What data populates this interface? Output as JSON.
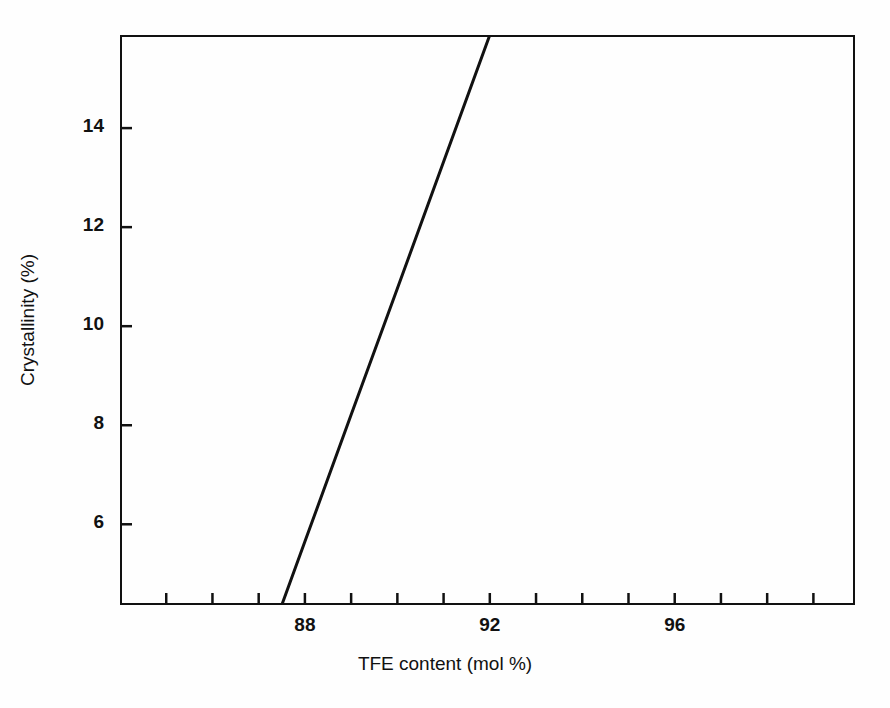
{
  "chart_data": {
    "type": "line",
    "title": "",
    "subtitle": "",
    "xlabel": "TFE content (mol %)",
    "ylabel": "Crystallinity (%)",
    "xlim": [
      84.0,
      99.9
    ],
    "ylim": [
      4.37,
      15.88
    ],
    "grid": false,
    "legend": null,
    "legend_position": "none",
    "x_tick_values": [
      84,
      85,
      86,
      87,
      88,
      89,
      90,
      91,
      92,
      93,
      94,
      95,
      96,
      97,
      98,
      99
    ],
    "x_tick_labels": [
      "",
      "",
      "",
      "",
      "88",
      "",
      "",
      "",
      "92",
      "",
      "",
      "",
      "96",
      "",
      "",
      ""
    ],
    "x_labeled_ticks": [
      {
        "value": 88,
        "label": "88"
      },
      {
        "value": 92,
        "label": "92"
      },
      {
        "value": 96,
        "label": "96"
      }
    ],
    "y_tick_values": [
      6,
      8,
      10,
      12,
      14
    ],
    "y_tick_labels": [
      "6",
      "8",
      "10",
      "12",
      "14"
    ],
    "series": [
      {
        "name": "Crystallinity vs TFE content",
        "color": "#111111",
        "line_width": 3,
        "style": "solid",
        "x": [
          87.5,
          88.0,
          89.0,
          90.0,
          91.0,
          92.0
        ],
        "y": [
          4.37,
          5.65,
          8.21,
          10.76,
          13.32,
          15.88
        ]
      }
    ],
    "annotations": []
  },
  "figure": {
    "background_color": "#fefefe",
    "axis_color": "#111111",
    "text_color": "#111111",
    "plot_box": {
      "left": 120,
      "top": 35,
      "width": 735,
      "height": 570
    }
  }
}
